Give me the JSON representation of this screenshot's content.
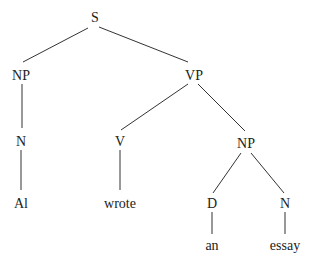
{
  "diagram": {
    "type": "syntax-tree",
    "nodes": [
      {
        "id": "s",
        "label": "S",
        "x": 95,
        "y": 22
      },
      {
        "id": "np1",
        "label": "NP",
        "x": 21,
        "y": 80
      },
      {
        "id": "vp",
        "label": "VP",
        "x": 194,
        "y": 80
      },
      {
        "id": "n1",
        "label": "N",
        "x": 21,
        "y": 146
      },
      {
        "id": "v",
        "label": "V",
        "x": 120,
        "y": 146
      },
      {
        "id": "np2",
        "label": "NP",
        "x": 246,
        "y": 148
      },
      {
        "id": "al",
        "label": "Al",
        "x": 21,
        "y": 208
      },
      {
        "id": "wrote",
        "label": "wrote",
        "x": 120,
        "y": 208
      },
      {
        "id": "d",
        "label": "D",
        "x": 212,
        "y": 208
      },
      {
        "id": "n2",
        "label": "N",
        "x": 285,
        "y": 208
      },
      {
        "id": "an",
        "label": "an",
        "x": 212,
        "y": 250
      },
      {
        "id": "essay",
        "label": "essay",
        "x": 285,
        "y": 250
      }
    ],
    "edges": [
      {
        "from": "s",
        "to": "np1",
        "x1": 88,
        "y1": 28,
        "x2": 23,
        "y2": 62
      },
      {
        "from": "s",
        "to": "vp",
        "x1": 99,
        "y1": 27,
        "x2": 188,
        "y2": 62
      },
      {
        "from": "np1",
        "to": "n1",
        "x1": 22,
        "y1": 84,
        "x2": 22,
        "y2": 128
      },
      {
        "from": "vp",
        "to": "v",
        "x1": 188,
        "y1": 84,
        "x2": 121,
        "y2": 130
      },
      {
        "from": "vp",
        "to": "np2",
        "x1": 198,
        "y1": 84,
        "x2": 245,
        "y2": 131
      },
      {
        "from": "n1",
        "to": "al",
        "x1": 21,
        "y1": 150,
        "x2": 21,
        "y2": 190
      },
      {
        "from": "v",
        "to": "wrote",
        "x1": 120,
        "y1": 150,
        "x2": 120,
        "y2": 190
      },
      {
        "from": "np2",
        "to": "d",
        "x1": 241,
        "y1": 153,
        "x2": 213,
        "y2": 193
      },
      {
        "from": "np2",
        "to": "n2",
        "x1": 251,
        "y1": 153,
        "x2": 284,
        "y2": 193
      },
      {
        "from": "d",
        "to": "an",
        "x1": 212,
        "y1": 212,
        "x2": 212,
        "y2": 234
      },
      {
        "from": "n2",
        "to": "essay",
        "x1": 285,
        "y1": 212,
        "x2": 285,
        "y2": 234
      }
    ]
  }
}
